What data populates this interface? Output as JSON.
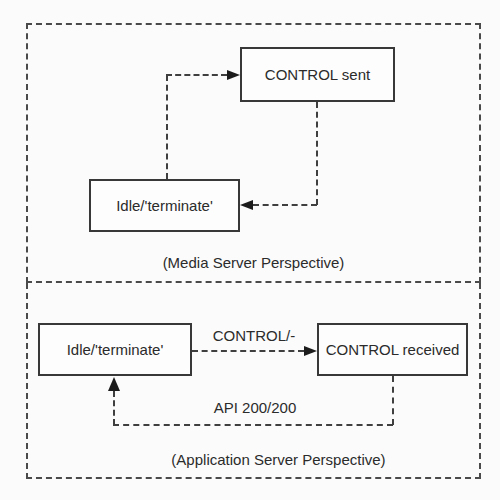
{
  "diagram": {
    "media_panel": {
      "caption": "(Media Server Perspective)",
      "states": {
        "control_sent": "CONTROL sent",
        "idle": "Idle/'terminate'"
      }
    },
    "app_panel": {
      "caption": "(Application Server Perspective)",
      "states": {
        "idle": "Idle/'terminate'",
        "control_received": "CONTROL received"
      },
      "transition_labels": {
        "control": "CONTROL/-",
        "api": "API 200/200"
      }
    }
  }
}
